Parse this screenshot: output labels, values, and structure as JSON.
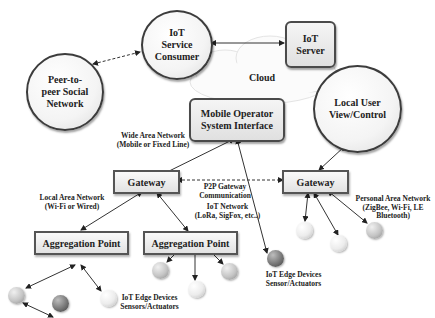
{
  "diagram": {
    "cloud": {
      "label": "Cloud"
    },
    "nodes": {
      "iot_service_consumer": {
        "label_lines": [
          "IoT",
          "Service",
          "Consumer"
        ]
      },
      "peer_social_network": {
        "label_lines": [
          "Peer-to-",
          "peer Social",
          "Network"
        ]
      },
      "iot_server": {
        "label_lines": [
          "IoT",
          "Server"
        ]
      },
      "local_user": {
        "label_lines": [
          "Local User",
          "View/Control"
        ]
      },
      "mobile_operator": {
        "label_lines": [
          "Mobile Operator",
          "System Interface"
        ]
      },
      "gateway_left": {
        "label": "Gateway"
      },
      "gateway_right": {
        "label": "Gateway"
      },
      "aggregation_left": {
        "label": "Aggregation Point"
      },
      "aggregation_mid": {
        "label": "Aggregation Point"
      }
    },
    "annotations": {
      "wan": [
        "Wide Area Network",
        "(Mobile or Fixed Line)"
      ],
      "lan": [
        "Local Area Network",
        "(Wi-Fi or Wired)"
      ],
      "p2p": [
        "P2P Gateway",
        "Communication"
      ],
      "iot_network": [
        "IoT Network",
        "(LoRa, SigFox, etc..)"
      ],
      "pan": [
        "Personal Area Network",
        "(ZigBee, Wi-Fi, LE",
        "Bluetooth)"
      ],
      "edge_left": [
        "IoT Edge Devices",
        "Sensors/Actuators"
      ],
      "edge_mid": [
        "IoT Edge Devices",
        "Sensor/Actuators"
      ]
    }
  }
}
